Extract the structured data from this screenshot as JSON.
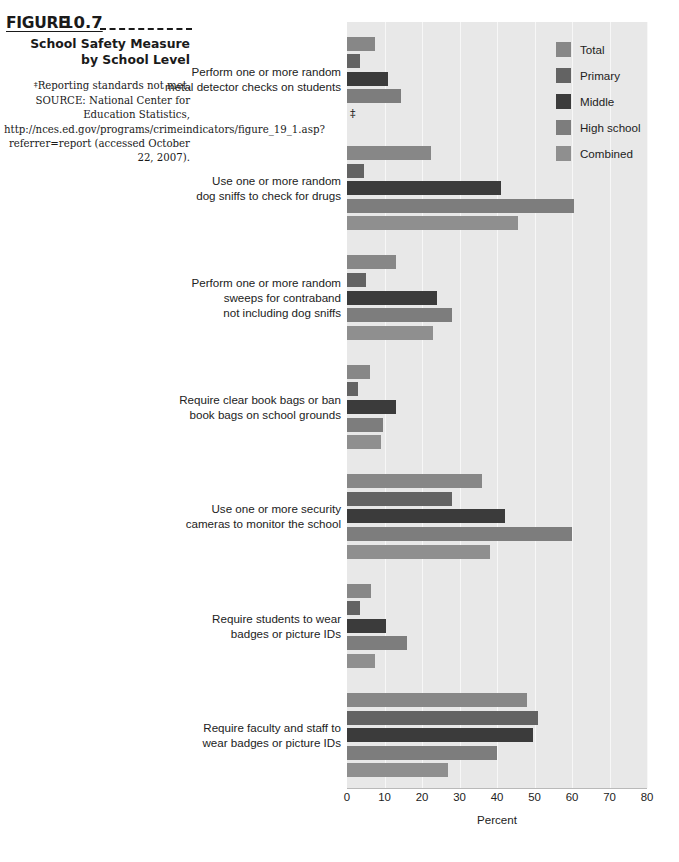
{
  "caption": {
    "figure_label": "FIGURE",
    "figure_number": "10.7",
    "title": "School Safety Measure by School Level",
    "note_symbol": "‡",
    "note_text": "Reporting standards not met.",
    "source": "SOURCE: National Center for Education Statistics, http://nces.ed.gov/programs/crimeindicators/figure_19_1.asp?referrer=report (accessed October 22, 2007)."
  },
  "legend": {
    "position": "top-right",
    "items": [
      {
        "label": "Total",
        "color": "#878787"
      },
      {
        "label": "Primary",
        "color": "#636363"
      },
      {
        "label": "Middle",
        "color": "#3b3b3b"
      },
      {
        "label": "High school",
        "color": "#7d7d7d"
      },
      {
        "label": "Combined",
        "color": "#8f8f8f"
      }
    ]
  },
  "axis": {
    "x_title": "Percent",
    "ticks": [
      "0",
      "10",
      "20",
      "30",
      "40",
      "50",
      "60",
      "70",
      "80"
    ]
  },
  "chart_data": {
    "type": "bar",
    "orientation": "horizontal",
    "title": "School Safety Measure by School Level",
    "xlabel": "Percent",
    "ylabel": "",
    "xlim": [
      0,
      80
    ],
    "grid": true,
    "legend_position": "top-right",
    "categories": [
      "Perform one or more random metal detector checks on students",
      "Use one or more random dog sniffs to check for drugs",
      "Perform one or more random sweeps for contraband not including dog sniffs",
      "Require clear book bags or ban book bags on school grounds",
      "Use one or more security cameras to monitor the school",
      "Require students to wear badges or picture IDs",
      "Require faculty and staff to wear badges or picture IDs"
    ],
    "category_lines": [
      [
        "Perform one or more random",
        "metal detector checks on students"
      ],
      [
        "Use one or more random",
        "dog sniffs to check for drugs"
      ],
      [
        "Perform one or more random",
        "sweeps for contraband",
        "not including dog sniffs"
      ],
      [
        "Require clear book bags or ban",
        "book bags on school grounds"
      ],
      [
        "Use one or more security",
        "cameras to monitor the school"
      ],
      [
        "Require students to wear",
        "badges or picture IDs"
      ],
      [
        "Require faculty and staff to",
        "wear badges or picture IDs"
      ]
    ],
    "series": [
      {
        "name": "Total",
        "color": "#878787",
        "values": [
          7.5,
          22.5,
          13.0,
          6.0,
          36.0,
          6.5,
          48.0
        ]
      },
      {
        "name": "Primary",
        "color": "#636363",
        "values": [
          3.5,
          4.5,
          5.0,
          3.0,
          28.0,
          3.5,
          51.0
        ]
      },
      {
        "name": "Middle",
        "color": "#3b3b3b",
        "values": [
          11.0,
          41.0,
          24.0,
          13.0,
          42.0,
          10.5,
          49.5
        ]
      },
      {
        "name": "High school",
        "color": "#7d7d7d",
        "values": [
          14.5,
          60.5,
          28.0,
          9.5,
          60.0,
          16.0,
          40.0
        ]
      },
      {
        "name": "Combined",
        "color": "#8f8f8f",
        "values": [
          null,
          45.5,
          23.0,
          9.0,
          38.0,
          7.5,
          27.0
        ]
      }
    ],
    "missing_marker": "‡",
    "missing_note": "Reporting standards not met."
  }
}
